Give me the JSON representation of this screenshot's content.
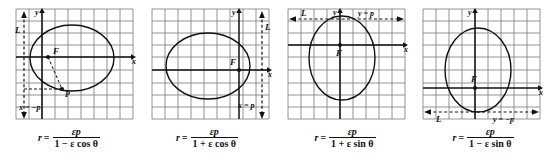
{
  "figure": {
    "panels": [
      {
        "id": "panel-1",
        "directrix_label": "x = −p",
        "directrix_line_label": "L",
        "directrix_orientation": "vertical-left",
        "focus_label": "F",
        "point_label": "P",
        "x_axis_label": "x",
        "y_axis_label": "y",
        "formula": {
          "lhs": "r",
          "equals": "=",
          "numerator": "εp",
          "denominator_sign": "−",
          "denominator": "1 − ε cos θ",
          "full": "r = εp / (1 − ε cos θ)"
        }
      },
      {
        "id": "panel-2",
        "directrix_label": "x = p",
        "directrix_line_label": "L",
        "directrix_orientation": "vertical-right",
        "focus_label": "F",
        "point_label": "",
        "x_axis_label": "x",
        "y_axis_label": "y",
        "formula": {
          "lhs": "r",
          "equals": "=",
          "numerator": "εp",
          "denominator_sign": "+",
          "denominator": "1 + ε cos θ",
          "full": "r = εp / (1 + ε cos θ)"
        }
      },
      {
        "id": "panel-3",
        "directrix_label": "y = p",
        "directrix_line_label": "L",
        "directrix_orientation": "horizontal-top",
        "focus_label": "F",
        "point_label": "",
        "x_axis_label": "x",
        "y_axis_label": "y",
        "formula": {
          "lhs": "r",
          "equals": "=",
          "numerator": "εp",
          "denominator_sign": "+",
          "denominator": "1 + ε sin θ",
          "full": "r = εp / (1 + ε sin θ)"
        }
      },
      {
        "id": "panel-4",
        "directrix_label": "y = −p",
        "directrix_line_label": "L",
        "directrix_orientation": "horizontal-bottom",
        "focus_label": "F",
        "point_label": "",
        "x_axis_label": "x",
        "y_axis_label": "y",
        "formula": {
          "lhs": "r",
          "equals": "=",
          "numerator": "εp",
          "denominator_sign": "−",
          "denominator": "1 − ε sin θ",
          "full": "r = εp / (1 − ε sin θ)"
        }
      }
    ],
    "colors": {
      "ink": "#1a1a1a",
      "grid": "#7a7a7a",
      "background": "#ffffff"
    }
  }
}
